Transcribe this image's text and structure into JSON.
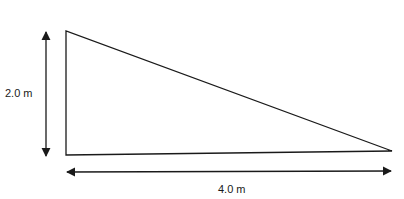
{
  "diagram": {
    "shape": "right-triangle",
    "vertical_dimension": {
      "label": "2.0 m",
      "value": 2.0,
      "unit": "m"
    },
    "horizontal_dimension": {
      "label": "4.0 m",
      "value": 4.0,
      "unit": "m"
    },
    "colors": {
      "stroke": "#1a1a1a",
      "background": "#ffffff"
    }
  }
}
